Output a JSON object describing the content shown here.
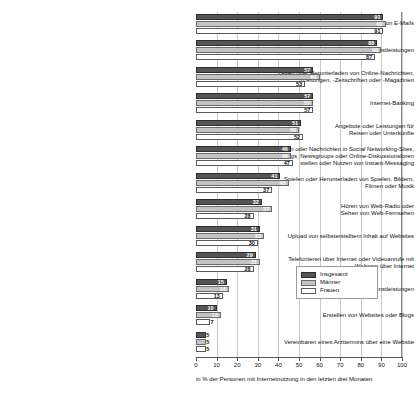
{
  "chart_data": {
    "type": "bar",
    "orientation": "horizontal",
    "title": "",
    "subtitle": "",
    "xlabel": "in % der Personen mit Internetnutzung in den letzten drei Monaten",
    "ylabel": "",
    "xlim": [
      0,
      100
    ],
    "xticks": [
      "0",
      "10",
      "20",
      "30",
      "40",
      "50",
      "60",
      "70",
      "80",
      "90",
      "100"
    ],
    "grid": true,
    "legend_position": "center-right",
    "categories": [
      "Versenden oder Empfangen von E-Mails",
      "Informationen über Waren oder Dienstleistungen",
      "Lesen oder Herunterladen von Online-Nachrichten,\n-Zeitungen, -Zeitschriften oder -Magazinen",
      "Internet-Banking",
      "Angebote oder Leistungen für\nReisen oder Unterkünfte",
      "Chatten oder Nachrichten in Social Networking-Sites,\nBlogs, Newsgroups oder Online-Diskussionsforen\nstellen oder Nutzen von Instant-Messaging",
      "Spielen oder Herunterladen von Spielen, Bildern,\nFilmen oder Musik",
      "Hören von Web-Radio oder\nSehen von Web-Fernsehen",
      "Upload von selbsterstelltem Inhalt auf Websites",
      "Telefonieren über Internet oder Videoanrufe mit\nWebcam über Internet",
      "Verkaufen von Waren oder Dienstleistungen",
      "Erstellen von Websites oder Blogs",
      "Vereinbaren eines Arzttermins über eine Website"
    ],
    "series": [
      {
        "name": "Insgesamt",
        "color": "#555555",
        "values": [
          91,
          88,
          57,
          57,
          51,
          46,
          41,
          32,
          31,
          29,
          15,
          10,
          5
        ]
      },
      {
        "name": "Männer",
        "color": "#c4c4c4",
        "values": [
          92,
          90,
          60,
          57,
          50,
          46,
          45,
          37,
          33,
          31,
          16,
          12,
          5
        ]
      },
      {
        "name": "Frauen",
        "color": "#ffffff",
        "values": [
          91,
          87,
          53,
          57,
          52,
          47,
          37,
          28,
          30,
          28,
          13,
          7,
          5
        ]
      }
    ]
  },
  "legend": {
    "entries": [
      "Insgesamt",
      "Männer",
      "Frauen"
    ]
  }
}
